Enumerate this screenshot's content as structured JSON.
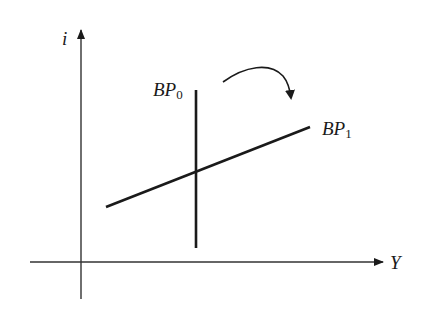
{
  "diagram": {
    "type": "economics-graph",
    "axes": {
      "y_label": "i",
      "x_label": "Y"
    },
    "curves": [
      {
        "id": "bp0",
        "label_main": "BP",
        "label_sub": "0",
        "orientation": "vertical"
      },
      {
        "id": "bp1",
        "label_main": "BP",
        "label_sub": "1",
        "orientation": "upward-sloping"
      }
    ],
    "annotation": {
      "type": "curved-arrow",
      "meaning": "rotation from BP0 to BP1"
    },
    "colors": {
      "line": "#1a1a1a",
      "axis": "#333333",
      "background": "#ffffff"
    }
  }
}
